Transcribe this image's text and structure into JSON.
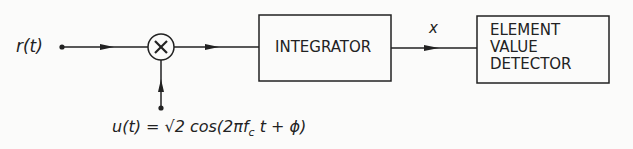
{
  "diagram": {
    "input_label": "r(t)",
    "multiplier_symbol": "×",
    "integrator_label": "INTEGRATOR",
    "integrator_output_label": "x",
    "detector_lines": [
      "ELEMENT",
      "VALUE",
      "DETECTOR"
    ],
    "reference_signal_label": "u(t) = √2 cos(2πf",
    "reference_signal_subscript": "c",
    "reference_signal_tail": " t + ϕ)"
  },
  "colors": {
    "stroke": "#222222",
    "background": "#fbfbfa"
  }
}
